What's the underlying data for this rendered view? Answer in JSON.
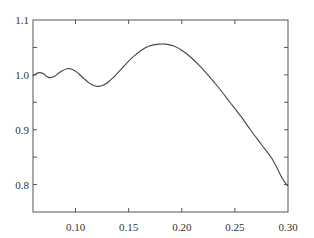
{
  "chart_data": {
    "type": "line",
    "title": "",
    "xlabel": "",
    "ylabel": "",
    "xlim": [
      0.06,
      0.3
    ],
    "ylim": [
      0.75,
      1.1
    ],
    "grid": false,
    "legend": null,
    "x_ticks": [
      0.1,
      0.15,
      0.2,
      0.25,
      0.3
    ],
    "x_tick_labels": [
      "0.10",
      "0.15",
      "0.20",
      "0.25",
      "0.30"
    ],
    "y_ticks": [
      0.8,
      0.85,
      0.9,
      0.95,
      1.0,
      1.05,
      1.1
    ],
    "y_tick_labels": [
      "0.8",
      "",
      "0.9",
      "",
      "1.0",
      "",
      "1.1"
    ],
    "series": [
      {
        "name": "curve",
        "color": "#444444",
        "x": [
          0.06,
          0.063,
          0.066,
          0.07,
          0.073,
          0.076,
          0.08,
          0.084,
          0.088,
          0.092,
          0.095,
          0.099,
          0.103,
          0.108,
          0.113,
          0.118,
          0.122,
          0.126,
          0.131,
          0.136,
          0.142,
          0.148,
          0.155,
          0.162,
          0.17,
          0.178,
          0.185,
          0.192,
          0.2,
          0.208,
          0.216,
          0.225,
          0.235,
          0.245,
          0.255,
          0.265,
          0.275,
          0.285,
          0.295,
          0.3
        ],
        "y": [
          0.998,
          1.002,
          1.004,
          1.002,
          0.997,
          0.995,
          0.997,
          1.003,
          1.008,
          1.011,
          1.011,
          1.008,
          1.002,
          0.993,
          0.985,
          0.98,
          0.979,
          0.981,
          0.987,
          0.996,
          1.008,
          1.021,
          1.034,
          1.045,
          1.053,
          1.056,
          1.056,
          1.053,
          1.045,
          1.033,
          1.018,
          0.999,
          0.976,
          0.951,
          0.926,
          0.899,
          0.873,
          0.847,
          0.81,
          0.797
        ]
      }
    ]
  }
}
